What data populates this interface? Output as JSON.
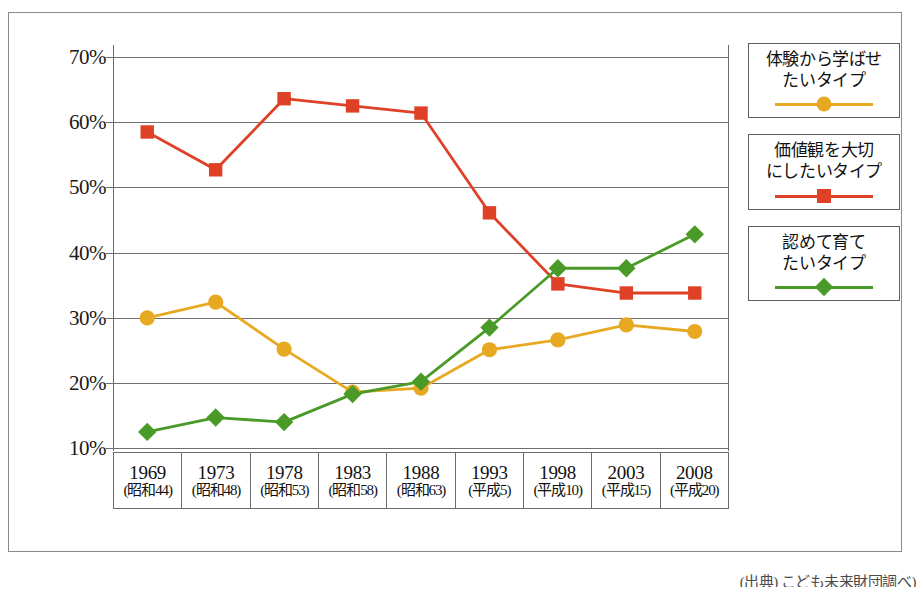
{
  "chart_data": {
    "type": "line",
    "title": "",
    "subtitle": "",
    "xlabel": "",
    "ylabel": "",
    "ylim": [
      0,
      70
    ],
    "yticks": [
      10,
      20,
      30,
      40,
      50,
      60,
      70
    ],
    "ytick_labels": [
      "10%",
      "20%",
      "30%",
      "40%",
      "50%",
      "60%",
      "70%"
    ],
    "grid": true,
    "legend_position": "right",
    "categories": [
      "1969",
      "1973",
      "1978",
      "1983",
      "1988",
      "1993",
      "1998",
      "2003",
      "2008"
    ],
    "category_sublabels": [
      "(昭和44)",
      "(昭和48)",
      "(昭和53)",
      "(昭和58)",
      "(昭和63)",
      "(平成5)",
      "(平成10)",
      "(平成15)",
      "(平成20)"
    ],
    "series": [
      {
        "name": "体験から学ばせ\nたいタイプ",
        "marker": "circle",
        "color": "#E8A922",
        "values": [
          30.0,
          32.4,
          25.2,
          18.6,
          19.2,
          25.1,
          26.6,
          28.9,
          27.9
        ]
      },
      {
        "name": "価値観を大切\nにしたいタイプ",
        "marker": "square",
        "color": "#DE4126",
        "values": [
          58.5,
          52.7,
          63.6,
          62.5,
          61.4,
          46.1,
          35.2,
          33.8,
          33.8
        ]
      },
      {
        "name": "認めて育て\nたいタイプ",
        "marker": "diamond",
        "color": "#4A9A28",
        "values": [
          12.5,
          14.7,
          14.0,
          18.3,
          20.2,
          28.5,
          37.6,
          37.6,
          42.8
        ]
      }
    ]
  },
  "legend": {
    "items": [
      {
        "label": "体験から学ばせ\nたいタイプ",
        "marker": "circle",
        "color": "#E8A922"
      },
      {
        "label": "価値観を大切\nにしたいタイプ",
        "marker": "square",
        "color": "#DE4126"
      },
      {
        "label": "認めて育て\nたいタイプ",
        "marker": "diamond",
        "color": "#4A9A28"
      }
    ]
  },
  "source_note": "(出典) こども未来財団調べ)",
  "colors": {
    "axis": "#6d6d6d",
    "grid": "#6f6f6f",
    "frame": "#8a8a8a",
    "text": "#111111"
  }
}
